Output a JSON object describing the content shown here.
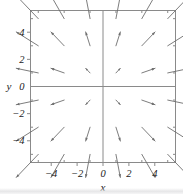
{
  "figure": {
    "background_color": "#ffffff",
    "frame_color": "#8a8a8a",
    "axis_color": "#8a8a8a",
    "arrow_color": "#6e6e6e",
    "tick_color": "#8a8a8a",
    "label_color": "#1a1a1a"
  },
  "axes": {
    "x_label": "x",
    "y_label": "y",
    "x_ticks": [
      {
        "value": -4,
        "label": "-4"
      },
      {
        "value": -2,
        "label": "-2"
      },
      {
        "value": 0,
        "label": "0"
      },
      {
        "value": 2,
        "label": "2"
      },
      {
        "value": 4,
        "label": "4"
      }
    ],
    "y_ticks": [
      {
        "value": -4,
        "label": "-4"
      },
      {
        "value": -2,
        "label": "-2"
      },
      {
        "value": 0,
        "label": "0"
      },
      {
        "value": 2,
        "label": "2"
      },
      {
        "value": 4,
        "label": "4"
      }
    ],
    "x_minor_ticks": [
      -5,
      -3,
      -1,
      1,
      3,
      5
    ],
    "y_minor_ticks": [
      -5,
      -3,
      -1,
      1,
      3,
      5
    ]
  },
  "chart_data": {
    "type": "scatter",
    "plot_kind": "vector-field",
    "title": "",
    "xlabel": "x",
    "ylabel": "y",
    "xlim": [
      -5.6,
      5.6
    ],
    "ylim": [
      -5.6,
      5.6
    ],
    "grid": false,
    "legend": null,
    "field_expression": "F(x, y) = (x, y)",
    "arrow_scale": 0.34,
    "sample_x": [
      -5,
      -3,
      -1,
      1,
      3,
      5
    ],
    "sample_y": [
      -5,
      -3,
      -1,
      1,
      3,
      5
    ],
    "vectors": [
      {
        "x": -5,
        "y": 5,
        "u": -5,
        "v": 5
      },
      {
        "x": -3,
        "y": 5,
        "u": -3,
        "v": 5
      },
      {
        "x": -1,
        "y": 5,
        "u": -1,
        "v": 5
      },
      {
        "x": 1,
        "y": 5,
        "u": 1,
        "v": 5
      },
      {
        "x": 3,
        "y": 5,
        "u": 3,
        "v": 5
      },
      {
        "x": 5,
        "y": 5,
        "u": 5,
        "v": 5
      },
      {
        "x": -5,
        "y": 3,
        "u": -5,
        "v": 3
      },
      {
        "x": -3,
        "y": 3,
        "u": -3,
        "v": 3
      },
      {
        "x": -1,
        "y": 3,
        "u": -1,
        "v": 3
      },
      {
        "x": 1,
        "y": 3,
        "u": 1,
        "v": 3
      },
      {
        "x": 3,
        "y": 3,
        "u": 3,
        "v": 3
      },
      {
        "x": 5,
        "y": 3,
        "u": 5,
        "v": 3
      },
      {
        "x": -5,
        "y": 1,
        "u": -5,
        "v": 1
      },
      {
        "x": -3,
        "y": 1,
        "u": -3,
        "v": 1
      },
      {
        "x": -1,
        "y": 1,
        "u": -1,
        "v": 1
      },
      {
        "x": 1,
        "y": 1,
        "u": 1,
        "v": 1
      },
      {
        "x": 3,
        "y": 1,
        "u": 3,
        "v": 1
      },
      {
        "x": 5,
        "y": 1,
        "u": 5,
        "v": 1
      },
      {
        "x": -5,
        "y": -1,
        "u": -5,
        "v": -1
      },
      {
        "x": -3,
        "y": -1,
        "u": -3,
        "v": -1
      },
      {
        "x": -1,
        "y": -1,
        "u": -1,
        "v": -1
      },
      {
        "x": 1,
        "y": -1,
        "u": 1,
        "v": -1
      },
      {
        "x": 3,
        "y": -1,
        "u": 3,
        "v": -1
      },
      {
        "x": 5,
        "y": -1,
        "u": 5,
        "v": -1
      },
      {
        "x": -5,
        "y": -3,
        "u": -5,
        "v": -3
      },
      {
        "x": -3,
        "y": -3,
        "u": -3,
        "v": -3
      },
      {
        "x": -1,
        "y": -3,
        "u": -1,
        "v": -3
      },
      {
        "x": 1,
        "y": -3,
        "u": 1,
        "v": -3
      },
      {
        "x": 3,
        "y": -3,
        "u": 3,
        "v": -3
      },
      {
        "x": 5,
        "y": -3,
        "u": 5,
        "v": -3
      },
      {
        "x": -5,
        "y": -5,
        "u": -5,
        "v": -5
      },
      {
        "x": -3,
        "y": -5,
        "u": -3,
        "v": -5
      },
      {
        "x": -1,
        "y": -5,
        "u": -1,
        "v": -5
      },
      {
        "x": 1,
        "y": -5,
        "u": 1,
        "v": -5
      },
      {
        "x": 3,
        "y": -5,
        "u": 3,
        "v": -5
      },
      {
        "x": 5,
        "y": -5,
        "u": 5,
        "v": -5
      }
    ]
  }
}
